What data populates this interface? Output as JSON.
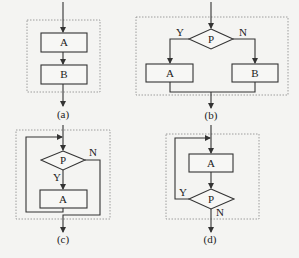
{
  "diagrams": {
    "a": {
      "caption": "(a)",
      "box1": "A",
      "box2": "B",
      "type": "sequence"
    },
    "b": {
      "caption": "(b)",
      "condition": "P",
      "yes_label": "Y",
      "no_label": "N",
      "yes_box": "A",
      "no_box": "B",
      "type": "selection"
    },
    "c": {
      "caption": "(c)",
      "condition": "P",
      "yes_label": "Y",
      "no_label": "N",
      "body_box": "A",
      "type": "while-loop"
    },
    "d": {
      "caption": "(d)",
      "condition": "P",
      "yes_label": "Y",
      "no_label": "N",
      "body_box": "A",
      "type": "do-while-loop"
    }
  },
  "colors": {
    "line": "#333333",
    "background": "#f4f4f2",
    "dashed_border": "#888888"
  }
}
